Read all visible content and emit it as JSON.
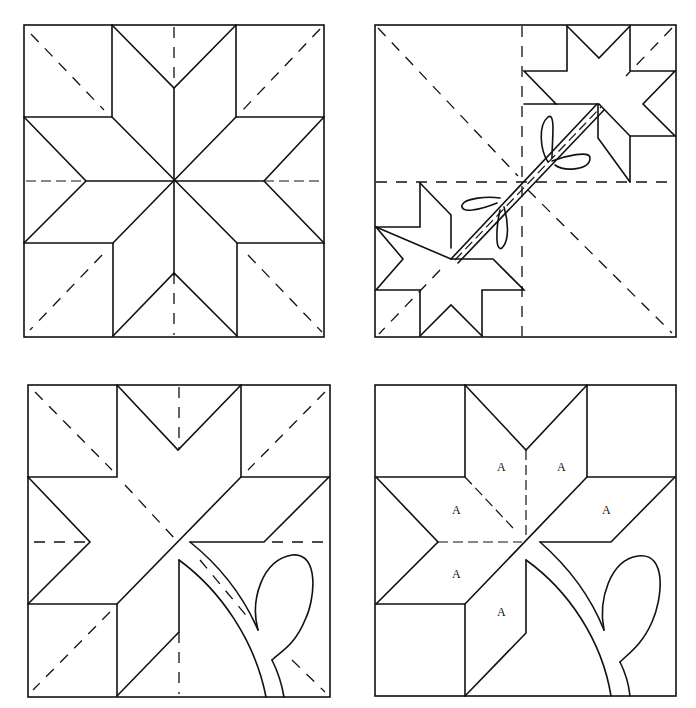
{
  "figure": {
    "title": "",
    "panels": [
      {
        "id": "panel-eight-point-star",
        "description": "Eight-point star block with dashed diagonal and center guide lines",
        "labels": []
      },
      {
        "id": "panel-two-stars-with-stem",
        "description": "Block divided in quarters with two partial stars joined by a stem and four leaf loops",
        "labels": []
      },
      {
        "id": "panel-partial-star-with-stem",
        "description": "Partial star block with curved stem and leaf loop, dashed guide lines",
        "labels": []
      },
      {
        "id": "panel-labeled-pieces",
        "description": "Partial star block with diamond pieces labeled A and curved stem with leaf",
        "labels": [
          {
            "text": "A",
            "x": 497,
            "y": 471
          },
          {
            "text": "A",
            "x": 557,
            "y": 471
          },
          {
            "text": "A",
            "x": 452,
            "y": 514
          },
          {
            "text": "A",
            "x": 602,
            "y": 514
          },
          {
            "text": "A",
            "x": 452,
            "y": 578
          },
          {
            "text": "A",
            "x": 497,
            "y": 616
          }
        ]
      }
    ],
    "colors": {
      "ink": "#111111",
      "paper": "#ffffff"
    }
  }
}
